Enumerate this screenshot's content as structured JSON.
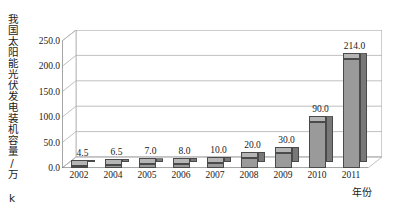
{
  "chart_data": {
    "type": "bar",
    "title": "",
    "xlabel": "年份",
    "ylabel": "我国太阳能光伏发电装机容量/万 kW",
    "categories": [
      "2002",
      "2004",
      "2005",
      "2006",
      "2007",
      "2008",
      "2009",
      "2010",
      "2011"
    ],
    "values": [
      4.5,
      6.5,
      7.0,
      8.0,
      10.0,
      20.0,
      30.0,
      90.0,
      214.0
    ],
    "value_labels": [
      "4.5",
      "6.5",
      "7.0",
      "8.0",
      "10.0",
      "20.0",
      "30.0",
      "90.0",
      "214.0"
    ],
    "ylim": [
      0.0,
      250.0
    ],
    "ytick_values": [
      0.0,
      50.0,
      100.0,
      150.0,
      200.0,
      250.0
    ],
    "ytick_labels": [
      "0.0",
      "50.0",
      "100.0",
      "150.0",
      "200.0",
      "250.0"
    ],
    "grid": true,
    "legend": "none",
    "style": "3d-column",
    "colors": {
      "bar_face": "#9a9a9a",
      "bar_top": "#b5b5b5",
      "bar_side": "#787878",
      "bar_edge": "#4a4a4a",
      "grid": "#b0b0b0",
      "axis": "#6e6e6e",
      "background": "#ffffff",
      "text": "#1a1a1a"
    }
  }
}
